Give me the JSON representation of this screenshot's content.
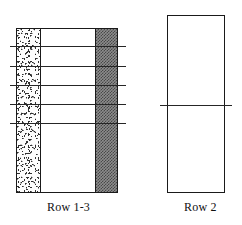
{
  "figure": {
    "title": "",
    "panels": [
      {
        "id": "row-1-3",
        "caption": "Row 1-3",
        "bands": [
          {
            "name": "speckled-band",
            "fill": "stipple",
            "color": "#fdfdfd"
          },
          {
            "name": "plain-band",
            "fill": "white",
            "color": "#ffffff"
          },
          {
            "name": "dark-hatched-band",
            "fill": "crosshatch",
            "color": "#8c8c8c"
          }
        ],
        "cross_lines": 5,
        "cross_line_positions": [
          46,
          66,
          85,
          104,
          123
        ]
      },
      {
        "id": "row-2",
        "caption": "Row 2",
        "bands": [
          {
            "name": "plain-band",
            "fill": "white",
            "color": "#ffffff"
          }
        ],
        "cross_lines": 1,
        "cross_line_positions": [
          105
        ]
      }
    ],
    "stroke_color": "#1a1a1a",
    "line_color": "#262626",
    "background": "#ffffff"
  }
}
